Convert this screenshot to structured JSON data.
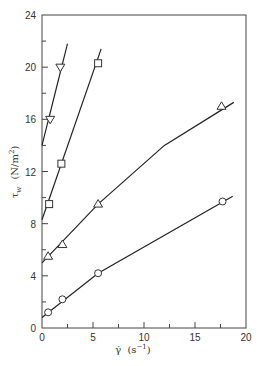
{
  "chart_data": {
    "type": "line",
    "title": "",
    "xlabel": "γ̇ (s⁻¹)",
    "ylabel": "τw (N/m²)",
    "xlim": [
      0,
      20
    ],
    "ylim": [
      0,
      24
    ],
    "x_ticks": [
      0,
      5,
      10,
      15,
      20
    ],
    "x_minor_ticks": [
      2.5,
      7.5,
      12.5,
      17.5
    ],
    "y_ticks": [
      0,
      4,
      8,
      12,
      16,
      20,
      24
    ],
    "y_minor_ticks": [
      2,
      6,
      10,
      14,
      18,
      22
    ],
    "grid": false,
    "legend": null,
    "series": [
      {
        "name": "inverted-triangle",
        "marker": "triangle-down",
        "points": [
          {
            "x": 0.8,
            "y": 16.0
          },
          {
            "x": 1.8,
            "y": 20.0
          }
        ],
        "fit_line": [
          {
            "x": 0,
            "y": 14.0
          },
          {
            "x": 2.5,
            "y": 21.8
          }
        ]
      },
      {
        "name": "square",
        "marker": "square",
        "points": [
          {
            "x": 0.7,
            "y": 9.5
          },
          {
            "x": 1.9,
            "y": 12.6
          },
          {
            "x": 5.5,
            "y": 20.3
          }
        ],
        "fit_line": [
          {
            "x": 0,
            "y": 8.3
          },
          {
            "x": 5.8,
            "y": 21.4
          }
        ]
      },
      {
        "name": "triangle",
        "marker": "triangle-up",
        "points": [
          {
            "x": 0.6,
            "y": 5.5
          },
          {
            "x": 2.0,
            "y": 6.4
          },
          {
            "x": 5.5,
            "y": 9.5
          },
          {
            "x": 17.6,
            "y": 17.0
          }
        ],
        "fit_line": [
          {
            "x": 0,
            "y": 5.0
          },
          {
            "x": 5.5,
            "y": 9.5
          },
          {
            "x": 12,
            "y": 14.0
          },
          {
            "x": 18.8,
            "y": 17.3
          }
        ]
      },
      {
        "name": "circle",
        "marker": "circle",
        "points": [
          {
            "x": 0.6,
            "y": 1.2
          },
          {
            "x": 2.0,
            "y": 2.2
          },
          {
            "x": 5.5,
            "y": 4.2
          },
          {
            "x": 17.7,
            "y": 9.7
          }
        ],
        "fit_line": [
          {
            "x": 0,
            "y": 0.8
          },
          {
            "x": 5.5,
            "y": 4.2
          },
          {
            "x": 18.7,
            "y": 10.1
          }
        ]
      }
    ]
  },
  "axes": {
    "x_label_main": "γ̇",
    "x_label_unit": "(s",
    "x_label_exp": "−1",
    "x_label_close": ")",
    "y_label_main": "τ",
    "y_label_sub": "w",
    "y_label_unit": "(N/m",
    "y_label_exp": "2",
    "y_label_close": ")"
  }
}
